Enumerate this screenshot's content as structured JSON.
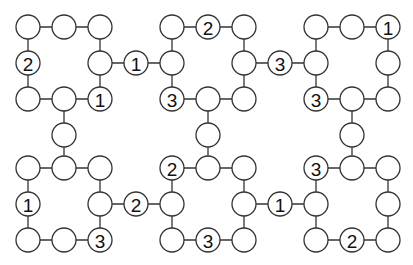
{
  "diagram": {
    "type": "number-circle-puzzle",
    "width": 413,
    "height": 265,
    "node_radius": 12,
    "colors": {
      "stroke": "#333333",
      "fill": "#ffffff",
      "text": "#111111"
    },
    "nodes": [
      {
        "id": "a1",
        "x": 28,
        "y": 27,
        "label": ""
      },
      {
        "id": "a2",
        "x": 64,
        "y": 27,
        "label": ""
      },
      {
        "id": "a3",
        "x": 100,
        "y": 27,
        "label": ""
      },
      {
        "id": "a4",
        "x": 28,
        "y": 63,
        "label": "2"
      },
      {
        "id": "a5",
        "x": 100,
        "y": 63,
        "label": ""
      },
      {
        "id": "a6",
        "x": 28,
        "y": 99,
        "label": ""
      },
      {
        "id": "a7",
        "x": 64,
        "y": 99,
        "label": ""
      },
      {
        "id": "a8",
        "x": 100,
        "y": 99,
        "label": "1"
      },
      {
        "id": "c1",
        "x": 136,
        "y": 63,
        "label": "1"
      },
      {
        "id": "c2",
        "x": 64,
        "y": 135,
        "label": ""
      },
      {
        "id": "b1",
        "x": 172,
        "y": 27,
        "label": ""
      },
      {
        "id": "b2",
        "x": 208,
        "y": 27,
        "label": "2"
      },
      {
        "id": "b3",
        "x": 244,
        "y": 27,
        "label": ""
      },
      {
        "id": "b4",
        "x": 172,
        "y": 63,
        "label": ""
      },
      {
        "id": "b5",
        "x": 244,
        "y": 63,
        "label": ""
      },
      {
        "id": "b6",
        "x": 172,
        "y": 99,
        "label": "3"
      },
      {
        "id": "b7",
        "x": 208,
        "y": 99,
        "label": ""
      },
      {
        "id": "b8",
        "x": 244,
        "y": 99,
        "label": ""
      },
      {
        "id": "c3",
        "x": 280,
        "y": 63,
        "label": "3"
      },
      {
        "id": "c4",
        "x": 208,
        "y": 135,
        "label": ""
      },
      {
        "id": "r1",
        "x": 316,
        "y": 27,
        "label": ""
      },
      {
        "id": "r2",
        "x": 352,
        "y": 27,
        "label": ""
      },
      {
        "id": "r3",
        "x": 388,
        "y": 27,
        "label": "1"
      },
      {
        "id": "r4",
        "x": 316,
        "y": 63,
        "label": ""
      },
      {
        "id": "r5",
        "x": 388,
        "y": 63,
        "label": ""
      },
      {
        "id": "r6",
        "x": 316,
        "y": 99,
        "label": "3"
      },
      {
        "id": "r7",
        "x": 352,
        "y": 99,
        "label": ""
      },
      {
        "id": "r8",
        "x": 388,
        "y": 99,
        "label": ""
      },
      {
        "id": "c5",
        "x": 352,
        "y": 135,
        "label": ""
      },
      {
        "id": "d1",
        "x": 28,
        "y": 168,
        "label": ""
      },
      {
        "id": "d2",
        "x": 64,
        "y": 168,
        "label": ""
      },
      {
        "id": "d3",
        "x": 100,
        "y": 168,
        "label": ""
      },
      {
        "id": "d4",
        "x": 28,
        "y": 204,
        "label": "1"
      },
      {
        "id": "d5",
        "x": 100,
        "y": 204,
        "label": ""
      },
      {
        "id": "d6",
        "x": 28,
        "y": 240,
        "label": ""
      },
      {
        "id": "d7",
        "x": 64,
        "y": 240,
        "label": ""
      },
      {
        "id": "d8",
        "x": 100,
        "y": 240,
        "label": "3"
      },
      {
        "id": "c6",
        "x": 136,
        "y": 204,
        "label": "2"
      },
      {
        "id": "e1",
        "x": 172,
        "y": 168,
        "label": "2"
      },
      {
        "id": "e2",
        "x": 208,
        "y": 168,
        "label": ""
      },
      {
        "id": "e3",
        "x": 244,
        "y": 168,
        "label": ""
      },
      {
        "id": "e4",
        "x": 172,
        "y": 204,
        "label": ""
      },
      {
        "id": "e5",
        "x": 244,
        "y": 204,
        "label": ""
      },
      {
        "id": "e6",
        "x": 172,
        "y": 240,
        "label": ""
      },
      {
        "id": "e7",
        "x": 208,
        "y": 240,
        "label": "3"
      },
      {
        "id": "e8",
        "x": 244,
        "y": 240,
        "label": ""
      },
      {
        "id": "c7",
        "x": 280,
        "y": 204,
        "label": "1"
      },
      {
        "id": "f1",
        "x": 316,
        "y": 168,
        "label": "3"
      },
      {
        "id": "f2",
        "x": 352,
        "y": 168,
        "label": ""
      },
      {
        "id": "f3",
        "x": 388,
        "y": 168,
        "label": ""
      },
      {
        "id": "f4",
        "x": 316,
        "y": 204,
        "label": ""
      },
      {
        "id": "f5",
        "x": 388,
        "y": 204,
        "label": ""
      },
      {
        "id": "f6",
        "x": 316,
        "y": 240,
        "label": ""
      },
      {
        "id": "f7",
        "x": 352,
        "y": 240,
        "label": "2"
      },
      {
        "id": "f8",
        "x": 388,
        "y": 240,
        "label": ""
      }
    ],
    "edges": [
      [
        "a1",
        "a2"
      ],
      [
        "a2",
        "a3"
      ],
      [
        "a1",
        "a4"
      ],
      [
        "a3",
        "a5"
      ],
      [
        "a4",
        "a6"
      ],
      [
        "a5",
        "a8"
      ],
      [
        "a6",
        "a7"
      ],
      [
        "a7",
        "a8"
      ],
      [
        "a5",
        "c1"
      ],
      [
        "c1",
        "b4"
      ],
      [
        "a7",
        "c2"
      ],
      [
        "c2",
        "d2"
      ],
      [
        "b1",
        "b2"
      ],
      [
        "b2",
        "b3"
      ],
      [
        "b1",
        "b4"
      ],
      [
        "b3",
        "b5"
      ],
      [
        "b4",
        "b6"
      ],
      [
        "b5",
        "b8"
      ],
      [
        "b6",
        "b7"
      ],
      [
        "b7",
        "b8"
      ],
      [
        "b5",
        "c3"
      ],
      [
        "c3",
        "r4"
      ],
      [
        "b7",
        "c4"
      ],
      [
        "c4",
        "e2"
      ],
      [
        "r1",
        "r2"
      ],
      [
        "r2",
        "r3"
      ],
      [
        "r1",
        "r4"
      ],
      [
        "r3",
        "r5"
      ],
      [
        "r4",
        "r6"
      ],
      [
        "r5",
        "r8"
      ],
      [
        "r6",
        "r7"
      ],
      [
        "r7",
        "r8"
      ],
      [
        "r7",
        "c5"
      ],
      [
        "c5",
        "f2"
      ],
      [
        "d1",
        "d2"
      ],
      [
        "d2",
        "d3"
      ],
      [
        "d1",
        "d4"
      ],
      [
        "d3",
        "d5"
      ],
      [
        "d4",
        "d6"
      ],
      [
        "d5",
        "d8"
      ],
      [
        "d6",
        "d7"
      ],
      [
        "d7",
        "d8"
      ],
      [
        "d5",
        "c6"
      ],
      [
        "c6",
        "e4"
      ],
      [
        "e1",
        "e2"
      ],
      [
        "e2",
        "e3"
      ],
      [
        "e1",
        "e4"
      ],
      [
        "e3",
        "e5"
      ],
      [
        "e4",
        "e6"
      ],
      [
        "e5",
        "e8"
      ],
      [
        "e6",
        "e7"
      ],
      [
        "e7",
        "e8"
      ],
      [
        "e5",
        "c7"
      ],
      [
        "c7",
        "f4"
      ],
      [
        "f1",
        "f2"
      ],
      [
        "f2",
        "f3"
      ],
      [
        "f1",
        "f4"
      ],
      [
        "f3",
        "f5"
      ],
      [
        "f4",
        "f6"
      ],
      [
        "f5",
        "f8"
      ],
      [
        "f6",
        "f7"
      ],
      [
        "f7",
        "f8"
      ]
    ]
  }
}
